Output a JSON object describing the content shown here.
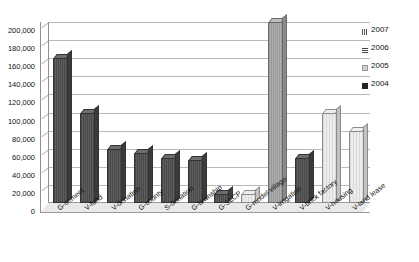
{
  "chart_data": {
    "type": "bar",
    "title": "",
    "xlabel": "",
    "ylabel": "",
    "ylim": [
      0,
      200000
    ],
    "grid": true,
    "legend_position": "right",
    "categories": [
      "G-cement",
      "V-fund",
      "V-donation",
      "G-county",
      "S-donation",
      "G-township",
      "G-SLCP",
      "G-model village",
      "V-irrigation",
      "V-brick factory",
      "V-housing",
      "V-land lease"
    ],
    "values": [
      160000,
      100000,
      60000,
      55000,
      50000,
      48000,
      10000,
      10000,
      200000,
      50000,
      100000,
      80000
    ],
    "ytick_labels": [
      "0",
      "20,000",
      "40,000",
      "60,000",
      "80,000",
      "100,000",
      "120,000",
      "140,000",
      "160,000",
      "180,000",
      "200,000"
    ],
    "ytick_values": [
      0,
      20000,
      40000,
      60000,
      80000,
      100000,
      120000,
      140000,
      160000,
      180000,
      200000
    ],
    "legend": [
      {
        "label": "2007",
        "marker": "y2007"
      },
      {
        "label": "2006",
        "marker": "y2006"
      },
      {
        "label": "2005",
        "marker": "y2005"
      },
      {
        "label": "2004",
        "marker": "y2004"
      }
    ]
  }
}
